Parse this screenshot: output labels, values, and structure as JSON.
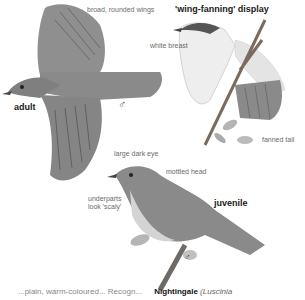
{
  "labels": {
    "broad_wings": "broad, rounded wings",
    "wing_fanning": "'wing-fanning' display",
    "white_breast": "white breast",
    "adult": "adult",
    "male_symbol_1": "♂",
    "male_symbol_2": "♂",
    "fanned_tail": "fanned tail",
    "large_dark_eye": "large dark eye",
    "mottled_head": "mottled head",
    "underparts_1": "underparts",
    "underparts_2": "look 'scaly'",
    "juvenile": "juvenile"
  },
  "footer": {
    "partial_text": "...plain, warm-coloured... Recogn...",
    "species": "Nightingale",
    "latin": "(Luscinia"
  },
  "colors": {
    "bird_fill": "#8a8a8a",
    "bird_dark": "#5a5a5a",
    "branch": "#7a6a60",
    "leaf": "#b5b5b5"
  }
}
